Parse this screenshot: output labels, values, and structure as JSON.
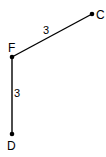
{
  "diagram": {
    "type": "graph",
    "vertices": [
      {
        "id": "C",
        "label": "C",
        "x": 92,
        "y": 14
      },
      {
        "id": "F",
        "label": "F",
        "x": 12,
        "y": 57
      },
      {
        "id": "D",
        "label": "D",
        "x": 12,
        "y": 134
      }
    ],
    "edges": [
      {
        "from": "F",
        "to": "C",
        "weight": "3"
      },
      {
        "from": "F",
        "to": "D",
        "weight": "3"
      }
    ],
    "colors": {
      "line": "#000000",
      "background": "#ffffff"
    }
  }
}
